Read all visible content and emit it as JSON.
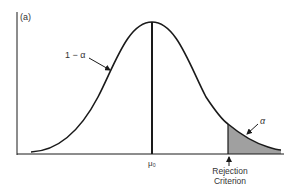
{
  "panel_label": "(a)",
  "curve_label": "1 − α",
  "tail_label": "α",
  "mean_label": "μ₀",
  "criterion_label": [
    "Rejection",
    "Criterion"
  ],
  "colors": {
    "line": "#1a1a1a",
    "shade": "#a0a0a0",
    "background": "#ffffff"
  }
}
